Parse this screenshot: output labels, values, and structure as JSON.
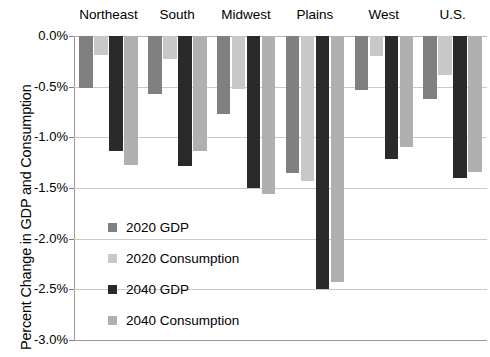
{
  "chart_data": {
    "type": "bar",
    "title": "",
    "subtitle": "",
    "xlabel": "",
    "ylabel": "Percent Change in GDP and Consumption",
    "ylim": [
      -3.0,
      0.0
    ],
    "y_tick_values": [
      0.0,
      -0.5,
      -1.0,
      -1.5,
      -2.0,
      -2.5,
      -3.0
    ],
    "y_tick_labels": [
      "0.0%",
      "-0.5%",
      "-1.0%",
      "-1.5%",
      "-2.0%",
      "-2.5%",
      "-3.0%"
    ],
    "grid": true,
    "grid_axis": "y",
    "legend_position": "inside-lower-left",
    "orientation": "vertical",
    "categories": [
      "Northeast",
      "South",
      "Midwest",
      "Plains",
      "West",
      "U.S."
    ],
    "series": [
      {
        "name": "2020 GDP",
        "color": "#808080",
        "values": [
          -0.51,
          -0.57,
          -0.77,
          -1.35,
          -0.53,
          -0.62
        ]
      },
      {
        "name": "2020 Consumption",
        "color": "#c8c8c8",
        "values": [
          -0.19,
          -0.23,
          -0.52,
          -1.43,
          -0.2,
          -0.38
        ]
      },
      {
        "name": "2040 GDP",
        "color": "#2a2a2a",
        "values": [
          -1.13,
          -1.28,
          -1.5,
          -2.5,
          -1.21,
          -1.4
        ]
      },
      {
        "name": "2040 Consumption",
        "color": "#b0b0b0",
        "values": [
          -1.27,
          -1.13,
          -1.56,
          -2.43,
          -1.1,
          -1.34
        ]
      }
    ],
    "annotations": []
  },
  "axis": {
    "y_title": "Percent Change in GDP and Consumption"
  },
  "colors": {
    "background": "#ffffff",
    "gridline": "#c9c9c9",
    "axis_line": "#9a9a9a",
    "text": "#000000",
    "series_2020_gdp": "#808080",
    "series_2020_consumption": "#c8c8c8",
    "series_2040_gdp": "#2a2a2a",
    "series_2040_consumption": "#b0b0b0"
  }
}
